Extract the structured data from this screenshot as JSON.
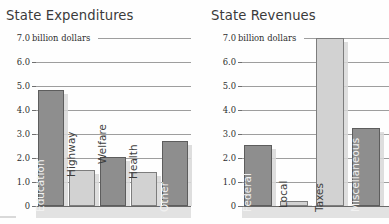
{
  "chart_data": [
    {
      "type": "bar",
      "title": "State Expenditures",
      "ylabel": "billion dollars",
      "xlabel": "",
      "ylim": [
        0,
        7
      ],
      "grid": true,
      "legend": "none",
      "tick_labels": [
        "7.0",
        "6.0",
        "5.0",
        "4.0",
        "3.0",
        "2.0",
        "1.0",
        "0"
      ],
      "tick_values": [
        7,
        6,
        5,
        4,
        3,
        2,
        1,
        0
      ],
      "units_note": "billion dollars",
      "categories": [
        "Education",
        "Highway",
        "Welfare",
        "Health",
        "Other"
      ],
      "values": [
        4.85,
        1.5,
        2.05,
        1.4,
        2.7
      ],
      "bar_styles": [
        "dark",
        "light",
        "dark",
        "light",
        "dark"
      ]
    },
    {
      "type": "bar",
      "title": "State Revenues",
      "ylabel": "billion dollars",
      "xlabel": "",
      "ylim": [
        0,
        7
      ],
      "grid": true,
      "legend": "none",
      "tick_labels": [
        "7.0",
        "6.0",
        "5.0",
        "4.0",
        "3.0",
        "2.0",
        "1.0",
        "0"
      ],
      "tick_values": [
        7,
        6,
        5,
        4,
        3,
        2,
        1,
        0
      ],
      "units_note": "billion dollars",
      "categories": [
        "Federal",
        "Local",
        "Taxes",
        "Miscellaneous"
      ],
      "values": [
        2.55,
        0.2,
        7.0,
        3.25
      ],
      "bar_styles": [
        "dark",
        "light",
        "light",
        "dark"
      ]
    }
  ],
  "expenditures": {
    "title": "State Expenditures",
    "units": "billion dollars",
    "ticks": {
      "t7": "7.0",
      "t6": "6.0",
      "t5": "5.0",
      "t4": "4.0",
      "t3": "3.0",
      "t2": "2.0",
      "t1": "1.0",
      "t0": "0"
    },
    "bars": [
      {
        "label": "Education",
        "value": 4.85
      },
      {
        "label": "Highway",
        "value": 1.5
      },
      {
        "label": "Welfare",
        "value": 2.05
      },
      {
        "label": "Health",
        "value": 1.4
      },
      {
        "label": "Other",
        "value": 2.7
      }
    ]
  },
  "revenues": {
    "title": "State Revenues",
    "units": "billion dollars",
    "ticks": {
      "t7": "7.0",
      "t6": "6.0",
      "t5": "5.0",
      "t4": "4.0",
      "t3": "3.0",
      "t2": "2.0",
      "t1": "1.0",
      "t0": "0"
    },
    "bars": [
      {
        "label": "Federal",
        "value": 2.55
      },
      {
        "label": "Local",
        "value": 0.2
      },
      {
        "label": "Taxes",
        "value": 7.0
      },
      {
        "label": "Miscellaneous",
        "value": 3.25
      }
    ]
  },
  "colors": {
    "bar_dark": "#8e8e8e",
    "bar_light": "#d2d2d2",
    "gridline": "#8d8d8d",
    "text": "#2f2f2f",
    "background": "#fefefe"
  }
}
